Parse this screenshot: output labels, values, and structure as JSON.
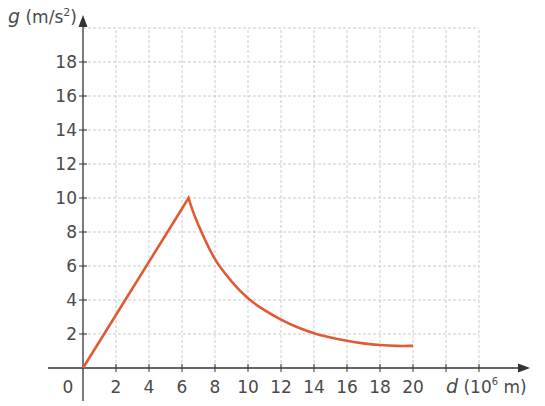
{
  "chart_data": {
    "type": "line",
    "title": "",
    "xlabel": "d (10^6 m)",
    "ylabel": "g (m/s^2)",
    "xlabel_parts": {
      "var": "d",
      "unit_pre": " (10",
      "sup": "6",
      "unit_post": " m)"
    },
    "ylabel_parts": {
      "var": "g",
      "unit_pre": " (m/s",
      "sup": "2",
      "unit_post": ")"
    },
    "xlim": [
      0,
      24
    ],
    "ylim": [
      0,
      20
    ],
    "x_ticks": [
      0,
      2,
      4,
      6,
      8,
      10,
      12,
      14,
      16,
      18,
      20
    ],
    "y_ticks": [
      2,
      4,
      6,
      8,
      10,
      12,
      14,
      16,
      18
    ],
    "grid": true,
    "grid_x_max": 24,
    "grid_y_max": 20,
    "line_color": "#e05a36",
    "series": [
      {
        "name": "g vs d",
        "x": [
          0,
          6.4,
          7,
          8,
          9,
          10,
          11,
          12,
          13,
          14,
          15,
          16,
          17,
          18,
          19,
          20
        ],
        "y": [
          0,
          10,
          8.4,
          6.4,
          5.1,
          4.1,
          3.4,
          2.85,
          2.4,
          2.05,
          1.8,
          1.6,
          1.45,
          1.35,
          1.3,
          1.3
        ]
      }
    ]
  },
  "labels": {
    "origin": "0"
  }
}
